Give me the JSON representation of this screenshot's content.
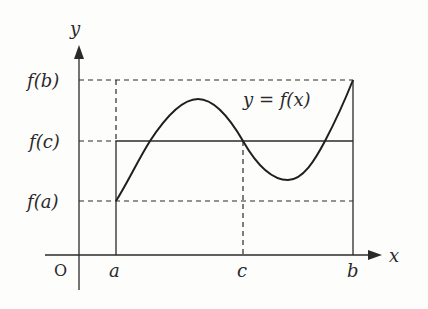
{
  "diagram": {
    "axes": {
      "x_label": "x",
      "y_label": "y",
      "origin_label": "O"
    },
    "x_ticks": [
      {
        "id": "a",
        "label": "a"
      },
      {
        "id": "c",
        "label": "c"
      },
      {
        "id": "b",
        "label": "b"
      }
    ],
    "y_ticks": [
      {
        "id": "fb",
        "label": "f(b)"
      },
      {
        "id": "fc",
        "label": "f(c)"
      },
      {
        "id": "fa",
        "label": "f(a)"
      }
    ],
    "curve_label": "y = f(x)",
    "colors": {
      "ink": "#2a2a2a",
      "background": "#fdfdfc"
    }
  }
}
